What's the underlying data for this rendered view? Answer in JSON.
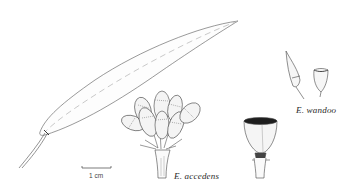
{
  "figure": {
    "labels": {
      "species_1": "E. accedens",
      "species_2": "E. wandoo",
      "scale_bar": "1 cm"
    },
    "parts": [
      {
        "name": "adult-leaf",
        "species": "E. accedens"
      },
      {
        "name": "bud-cluster",
        "species": "E. accedens"
      },
      {
        "name": "fruit",
        "species": "E. accedens"
      },
      {
        "name": "bud",
        "species": "E. wandoo"
      },
      {
        "name": "fruit",
        "species": "E. wandoo"
      }
    ],
    "colors": {
      "background": "#ffffff",
      "ink": "#3a3a3a",
      "shade": "#9a9a9a"
    }
  }
}
